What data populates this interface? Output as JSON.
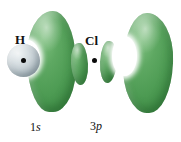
{
  "figure": {
    "background_color": "#ffffff"
  },
  "atoms": [
    {
      "symbol": "H",
      "orbital": "1s",
      "orbital_number": "1",
      "orbital_letter": "s",
      "nucleus_marker": "nucleus-dot",
      "sphere_color": "#c4ced3"
    },
    {
      "symbol": "Cl",
      "orbital": "3p",
      "orbital_number": "3",
      "orbital_letter": "p",
      "nucleus_marker": "nucleus-dot",
      "lobe_color": "#4d9b53"
    }
  ],
  "labels": {
    "h_atom": "H",
    "cl_atom": "Cl",
    "caption_1s_number": "1",
    "caption_1s_letter": "s",
    "caption_3p_number": "3",
    "caption_3p_letter": "p"
  },
  "colors": {
    "orbital_green_light": "#7ec07f",
    "orbital_green_mid": "#4d9b53",
    "orbital_green_dark": "#327a3a",
    "sphere_gray_blue": "#c4ced3",
    "nucleus_black": "#0a0a0a",
    "background": "#ffffff"
  },
  "shapes": {
    "large_lobe_left": "kidney-lobe",
    "large_lobe_right": "kidney-lobe",
    "small_lobe_left": "inner-lobe",
    "small_lobe_right": "inner-lobe",
    "hydrogen_sphere": "sphere"
  }
}
